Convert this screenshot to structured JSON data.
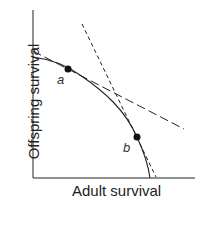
{
  "diagram": {
    "x_axis_label": "Adult survival",
    "y_axis_label": "Offspring survival",
    "points": [
      {
        "label": "a",
        "x": 68,
        "y": 69
      },
      {
        "label": "b",
        "x": 137,
        "y": 137
      }
    ],
    "curve": "concave trade-off curve",
    "tangent_lines": [
      {
        "style": "long-dash",
        "tangent_at": "a"
      },
      {
        "style": "short-dash",
        "tangent_at": "b"
      }
    ],
    "colors": {
      "line": "#222222",
      "background": "#ffffff"
    }
  }
}
